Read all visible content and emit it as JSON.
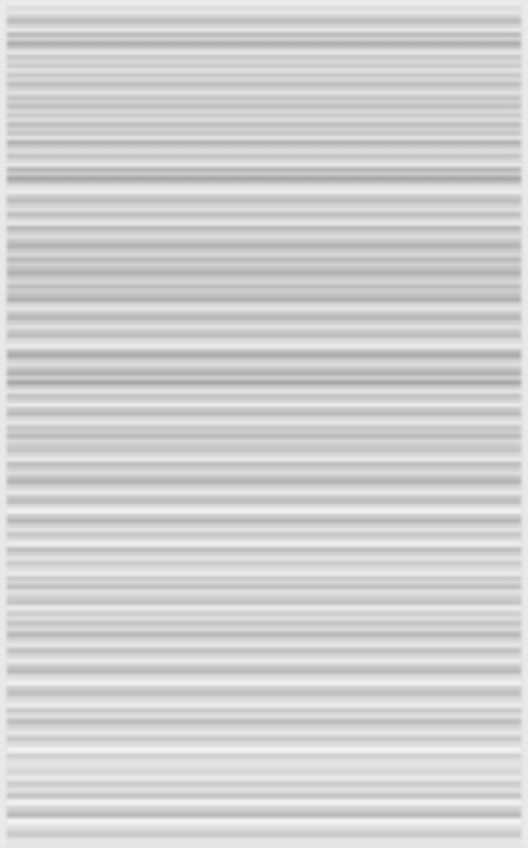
{
  "meta": {
    "width": 528,
    "height": 848,
    "render_description": "Screenshot of a text document page rendered with extreme horizontal motion blur; no glyphs, icons, or colour accents are legible.",
    "legible_text": "none",
    "color_mode": "grayscale"
  },
  "palette": {
    "page_background": "#e3e3e3",
    "margin_light": "#f2f2f2",
    "text_band_dark": "#a9a9a9",
    "text_band_mid": "#c2c2c2",
    "text_band_light": "#d6d6d6",
    "gap_light": "#eeeeee",
    "gap_white": "#f7f7f7"
  },
  "layout": {
    "left_margin_px": 7,
    "right_margin_px": 7,
    "content_left_px": 7,
    "content_right_px": 521
  },
  "blur": {
    "axis": "horizontal",
    "radius_px": 1.6
  },
  "bands": [
    {
      "y": 0,
      "h": 6,
      "tone": "#eeeeee"
    },
    {
      "y": 6,
      "h": 4,
      "tone": "#d9d9d9"
    },
    {
      "y": 10,
      "h": 5,
      "tone": "#e8e8e8"
    },
    {
      "y": 15,
      "h": 4,
      "tone": "#cfcfcf"
    },
    {
      "y": 19,
      "h": 4,
      "tone": "#b6b6b6"
    },
    {
      "y": 23,
      "h": 5,
      "tone": "#d2d2d2"
    },
    {
      "y": 28,
      "h": 4,
      "tone": "#f0f0f0"
    },
    {
      "y": 32,
      "h": 5,
      "tone": "#b9b9b9"
    },
    {
      "y": 37,
      "h": 4,
      "tone": "#d8d8d8"
    },
    {
      "y": 41,
      "h": 5,
      "tone": "#ababab"
    },
    {
      "y": 46,
      "h": 4,
      "tone": "#cbcbcb"
    },
    {
      "y": 50,
      "h": 5,
      "tone": "#eaeaea"
    },
    {
      "y": 55,
      "h": 4,
      "tone": "#c4c4c4"
    },
    {
      "y": 59,
      "h": 5,
      "tone": "#dddddd"
    },
    {
      "y": 64,
      "h": 4,
      "tone": "#cacaca"
    },
    {
      "y": 68,
      "h": 5,
      "tone": "#e6e6e6"
    },
    {
      "y": 73,
      "h": 4,
      "tone": "#c8c8c8"
    },
    {
      "y": 77,
      "h": 5,
      "tone": "#dcdcdc"
    },
    {
      "y": 82,
      "h": 4,
      "tone": "#bdbdbd"
    },
    {
      "y": 86,
      "h": 5,
      "tone": "#d4d4d4"
    },
    {
      "y": 91,
      "h": 4,
      "tone": "#e9e9e9"
    },
    {
      "y": 95,
      "h": 5,
      "tone": "#c6c6c6"
    },
    {
      "y": 100,
      "h": 4,
      "tone": "#d8d8d8"
    },
    {
      "y": 104,
      "h": 5,
      "tone": "#c1c1c1"
    },
    {
      "y": 109,
      "h": 4,
      "tone": "#dfdfdf"
    },
    {
      "y": 113,
      "h": 5,
      "tone": "#cdcdcd"
    },
    {
      "y": 118,
      "h": 4,
      "tone": "#e4e4e4"
    },
    {
      "y": 122,
      "h": 5,
      "tone": "#bfbfbf"
    },
    {
      "y": 127,
      "h": 4,
      "tone": "#d6d6d6"
    },
    {
      "y": 131,
      "h": 5,
      "tone": "#cacaca"
    },
    {
      "y": 136,
      "h": 4,
      "tone": "#ededed"
    },
    {
      "y": 140,
      "h": 5,
      "tone": "#b4b4b4"
    },
    {
      "y": 145,
      "h": 4,
      "tone": "#d0d0d0"
    },
    {
      "y": 149,
      "h": 5,
      "tone": "#e1e1e1"
    },
    {
      "y": 154,
      "h": 4,
      "tone": "#c3c3c3"
    },
    {
      "y": 158,
      "h": 5,
      "tone": "#dbdbdb"
    },
    {
      "y": 163,
      "h": 4,
      "tone": "#f1f1f1"
    },
    {
      "y": 167,
      "h": 5,
      "tone": "#b8b8b8"
    },
    {
      "y": 172,
      "h": 4,
      "tone": "#d3d3d3"
    },
    {
      "y": 176,
      "h": 5,
      "tone": "#a8a8a8"
    },
    {
      "y": 181,
      "h": 4,
      "tone": "#c9c9c9"
    },
    {
      "y": 185,
      "h": 5,
      "tone": "#e7e7e7"
    },
    {
      "y": 190,
      "h": 4,
      "tone": "#f3f3f3"
    },
    {
      "y": 194,
      "h": 5,
      "tone": "#cecece"
    },
    {
      "y": 199,
      "h": 4,
      "tone": "#bcbcbc"
    },
    {
      "y": 203,
      "h": 5,
      "tone": "#d7d7d7"
    },
    {
      "y": 208,
      "h": 4,
      "tone": "#e5e5e5"
    },
    {
      "y": 212,
      "h": 5,
      "tone": "#c0c0c0"
    },
    {
      "y": 217,
      "h": 4,
      "tone": "#dadada"
    },
    {
      "y": 221,
      "h": 5,
      "tone": "#ececec"
    },
    {
      "y": 226,
      "h": 4,
      "tone": "#b5b5b5"
    },
    {
      "y": 230,
      "h": 5,
      "tone": "#d1d1d1"
    },
    {
      "y": 235,
      "h": 4,
      "tone": "#e3e3e3"
    },
    {
      "y": 239,
      "h": 5,
      "tone": "#c7c7c7"
    },
    {
      "y": 244,
      "h": 4,
      "tone": "#b2b2b2"
    },
    {
      "y": 248,
      "h": 5,
      "tone": "#cccccc"
    },
    {
      "y": 253,
      "h": 4,
      "tone": "#dedede"
    },
    {
      "y": 257,
      "h": 5,
      "tone": "#bababa"
    },
    {
      "y": 262,
      "h": 4,
      "tone": "#d5d5d5"
    },
    {
      "y": 266,
      "h": 5,
      "tone": "#c5c5c5"
    },
    {
      "y": 271,
      "h": 4,
      "tone": "#b0b0b0"
    },
    {
      "y": 275,
      "h": 5,
      "tone": "#cbcbcb"
    },
    {
      "y": 280,
      "h": 4,
      "tone": "#dddddd"
    },
    {
      "y": 284,
      "h": 5,
      "tone": "#bebebe"
    },
    {
      "y": 289,
      "h": 4,
      "tone": "#d4d4d4"
    },
    {
      "y": 293,
      "h": 5,
      "tone": "#c2c2c2"
    },
    {
      "y": 298,
      "h": 4,
      "tone": "#aeaeae"
    },
    {
      "y": 302,
      "h": 5,
      "tone": "#d9d9d9"
    },
    {
      "y": 307,
      "h": 4,
      "tone": "#ebebeb"
    },
    {
      "y": 311,
      "h": 5,
      "tone": "#c9c9c9"
    },
    {
      "y": 316,
      "h": 4,
      "tone": "#b7b7b7"
    },
    {
      "y": 320,
      "h": 5,
      "tone": "#d2d2d2"
    },
    {
      "y": 325,
      "h": 4,
      "tone": "#e6e6e6"
    },
    {
      "y": 329,
      "h": 5,
      "tone": "#cdcdcd"
    },
    {
      "y": 334,
      "h": 4,
      "tone": "#bbbbbb"
    },
    {
      "y": 338,
      "h": 6,
      "tone": "#dfdfdf"
    },
    {
      "y": 344,
      "h": 5,
      "tone": "#f0f0f0"
    },
    {
      "y": 349,
      "h": 4,
      "tone": "#c4c4c4"
    },
    {
      "y": 353,
      "h": 5,
      "tone": "#acacac"
    },
    {
      "y": 358,
      "h": 4,
      "tone": "#d0d0d0"
    },
    {
      "y": 362,
      "h": 5,
      "tone": "#e2e2e2"
    },
    {
      "y": 367,
      "h": 4,
      "tone": "#c6c6c6"
    },
    {
      "y": 371,
      "h": 5,
      "tone": "#b3b3b3"
    },
    {
      "y": 376,
      "h": 4,
      "tone": "#d8d8d8"
    },
    {
      "y": 380,
      "h": 5,
      "tone": "#a7a7a7"
    },
    {
      "y": 385,
      "h": 4,
      "tone": "#cfcfcf"
    },
    {
      "y": 389,
      "h": 5,
      "tone": "#e8e8e8"
    },
    {
      "y": 394,
      "h": 4,
      "tone": "#c1c1c1"
    },
    {
      "y": 398,
      "h": 5,
      "tone": "#d6d6d6"
    },
    {
      "y": 403,
      "h": 4,
      "tone": "#f4f4f4"
    },
    {
      "y": 407,
      "h": 5,
      "tone": "#cacaca"
    },
    {
      "y": 412,
      "h": 4,
      "tone": "#b9b9b9"
    },
    {
      "y": 416,
      "h": 5,
      "tone": "#dcdcdc"
    },
    {
      "y": 421,
      "h": 4,
      "tone": "#eeeeee"
    },
    {
      "y": 425,
      "h": 5,
      "tone": "#c8c8c8"
    },
    {
      "y": 430,
      "h": 4,
      "tone": "#d3d3d3"
    },
    {
      "y": 434,
      "h": 5,
      "tone": "#bdbdbd"
    },
    {
      "y": 439,
      "h": 4,
      "tone": "#e0e0e0"
    },
    {
      "y": 443,
      "h": 5,
      "tone": "#cecece"
    },
    {
      "y": 448,
      "h": 4,
      "tone": "#c3c3c3"
    },
    {
      "y": 452,
      "h": 5,
      "tone": "#dadada"
    },
    {
      "y": 457,
      "h": 5,
      "tone": "#ededed"
    },
    {
      "y": 462,
      "h": 4,
      "tone": "#bcbcbc"
    },
    {
      "y": 466,
      "h": 5,
      "tone": "#d1d1d1"
    },
    {
      "y": 471,
      "h": 4,
      "tone": "#e4e4e4"
    },
    {
      "y": 475,
      "h": 5,
      "tone": "#c5c5c5"
    },
    {
      "y": 480,
      "h": 4,
      "tone": "#b1b1b1"
    },
    {
      "y": 484,
      "h": 6,
      "tone": "#d7d7d7"
    },
    {
      "y": 490,
      "h": 5,
      "tone": "#efefef"
    },
    {
      "y": 495,
      "h": 4,
      "tone": "#cbcbcb"
    },
    {
      "y": 499,
      "h": 5,
      "tone": "#bfbfbf"
    },
    {
      "y": 504,
      "h": 4,
      "tone": "#dedede"
    },
    {
      "y": 508,
      "h": 6,
      "tone": "#f5f5f5"
    },
    {
      "y": 514,
      "h": 5,
      "tone": "#cccccc"
    },
    {
      "y": 519,
      "h": 4,
      "tone": "#b6b6b6"
    },
    {
      "y": 523,
      "h": 5,
      "tone": "#d5d5d5"
    },
    {
      "y": 528,
      "h": 4,
      "tone": "#e9e9e9"
    },
    {
      "y": 532,
      "h": 5,
      "tone": "#c7c7c7"
    },
    {
      "y": 537,
      "h": 4,
      "tone": "#dbdbdb"
    },
    {
      "y": 541,
      "h": 6,
      "tone": "#f2f2f2"
    },
    {
      "y": 547,
      "h": 5,
      "tone": "#c0c0c0"
    },
    {
      "y": 552,
      "h": 4,
      "tone": "#d4d4d4"
    },
    {
      "y": 556,
      "h": 5,
      "tone": "#e7e7e7"
    },
    {
      "y": 561,
      "h": 4,
      "tone": "#c9c9c9"
    },
    {
      "y": 565,
      "h": 6,
      "tone": "#dfdfdf"
    },
    {
      "y": 571,
      "h": 5,
      "tone": "#f1f1f1"
    },
    {
      "y": 576,
      "h": 4,
      "tone": "#cacaca"
    },
    {
      "y": 580,
      "h": 5,
      "tone": "#d9d9d9"
    },
    {
      "y": 585,
      "h": 4,
      "tone": "#bebebe"
    },
    {
      "y": 589,
      "h": 6,
      "tone": "#e5e5e5"
    },
    {
      "y": 595,
      "h": 5,
      "tone": "#d2d2d2"
    },
    {
      "y": 600,
      "h": 5,
      "tone": "#c4c4c4"
    },
    {
      "y": 605,
      "h": 6,
      "tone": "#eeeeee"
    },
    {
      "y": 611,
      "h": 5,
      "tone": "#d0d0d0"
    },
    {
      "y": 616,
      "h": 5,
      "tone": "#e2e2e2"
    },
    {
      "y": 621,
      "h": 5,
      "tone": "#c6c6c6"
    },
    {
      "y": 626,
      "h": 6,
      "tone": "#dddddd"
    },
    {
      "y": 632,
      "h": 5,
      "tone": "#b8b8b8"
    },
    {
      "y": 637,
      "h": 5,
      "tone": "#d6d6d6"
    },
    {
      "y": 642,
      "h": 6,
      "tone": "#e8e8e8"
    },
    {
      "y": 648,
      "h": 5,
      "tone": "#c2c2c2"
    },
    {
      "y": 653,
      "h": 5,
      "tone": "#d8d8d8"
    },
    {
      "y": 658,
      "h": 6,
      "tone": "#ececec"
    },
    {
      "y": 664,
      "h": 5,
      "tone": "#cdcdcd"
    },
    {
      "y": 669,
      "h": 5,
      "tone": "#bbbbbb"
    },
    {
      "y": 674,
      "h": 6,
      "tone": "#e1e1e1"
    },
    {
      "y": 680,
      "h": 6,
      "tone": "#f3f3f3"
    },
    {
      "y": 686,
      "h": 5,
      "tone": "#cecece"
    },
    {
      "y": 691,
      "h": 5,
      "tone": "#c1c1c1"
    },
    {
      "y": 696,
      "h": 6,
      "tone": "#dcdcdc"
    },
    {
      "y": 702,
      "h": 6,
      "tone": "#efefef"
    },
    {
      "y": 708,
      "h": 5,
      "tone": "#cbcbcb"
    },
    {
      "y": 713,
      "h": 6,
      "tone": "#e3e3e3"
    },
    {
      "y": 719,
      "h": 5,
      "tone": "#bdbdbd"
    },
    {
      "y": 724,
      "h": 6,
      "tone": "#d7d7d7"
    },
    {
      "y": 730,
      "h": 6,
      "tone": "#ebebeb"
    },
    {
      "y": 736,
      "h": 5,
      "tone": "#c8c8c8"
    },
    {
      "y": 741,
      "h": 6,
      "tone": "#e0e0e0"
    },
    {
      "y": 747,
      "h": 6,
      "tone": "#f7f7f7"
    },
    {
      "y": 753,
      "h": 6,
      "tone": "#d3d3d3"
    },
    {
      "y": 759,
      "h": 9,
      "tone": "#e6e6e6"
    },
    {
      "y": 768,
      "h": 7,
      "tone": "#dadada"
    },
    {
      "y": 775,
      "h": 6,
      "tone": "#ededed"
    },
    {
      "y": 781,
      "h": 6,
      "tone": "#cfcfcf"
    },
    {
      "y": 787,
      "h": 6,
      "tone": "#e4e4e4"
    },
    {
      "y": 793,
      "h": 6,
      "tone": "#c5c5c5"
    },
    {
      "y": 799,
      "h": 7,
      "tone": "#f5f5f5"
    },
    {
      "y": 806,
      "h": 6,
      "tone": "#d1d1d1"
    },
    {
      "y": 812,
      "h": 6,
      "tone": "#b9b9b9"
    },
    {
      "y": 818,
      "h": 7,
      "tone": "#f6f6f6"
    },
    {
      "y": 825,
      "h": 6,
      "tone": "#dedede"
    },
    {
      "y": 831,
      "h": 7,
      "tone": "#cacaca"
    },
    {
      "y": 838,
      "h": 10,
      "tone": "#e8e8e8"
    }
  ]
}
